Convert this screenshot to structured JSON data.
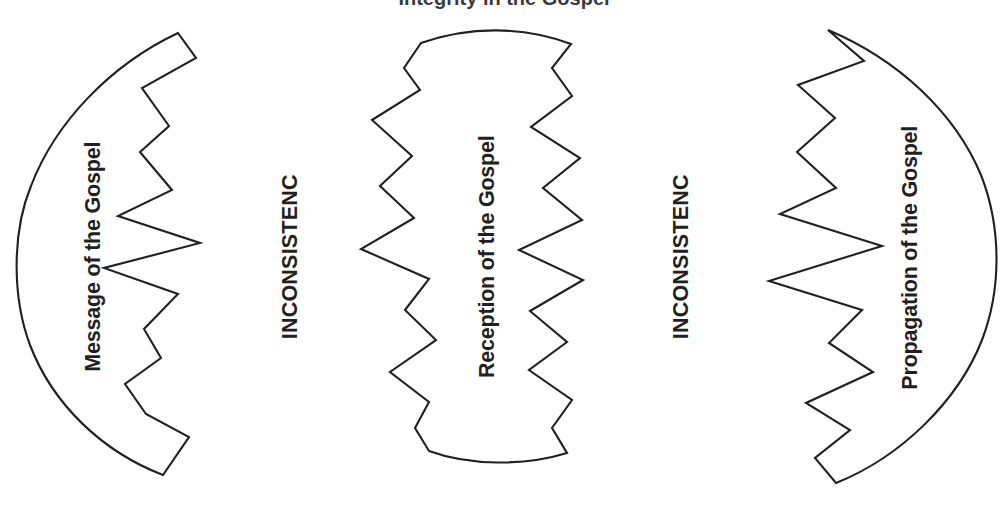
{
  "diagram": {
    "type": "process-flow",
    "title_partial": "Integrity in the Gospel",
    "background_color": "#ffffff",
    "stroke_color": "#231f20",
    "text_color": "#231f20",
    "orientation": "horizontal-left-to-right",
    "text_orientation": "vertical-rotated-90-ccw",
    "shapes": [
      {
        "id": "message",
        "label": "Message of the Gospel",
        "edge_left": "smooth-arc",
        "edge_right": "zigzag",
        "role": "stage"
      },
      {
        "id": "reception",
        "label": "Reception of the Gospel",
        "edge_left": "zigzag",
        "edge_right": "zigzag",
        "role": "stage"
      },
      {
        "id": "propagation",
        "label": "Propagation of the Gospel",
        "edge_left": "zigzag",
        "edge_right": "smooth-arc",
        "role": "stage"
      }
    ],
    "connectors": [
      {
        "id": "gap-1",
        "label": "INCONSISTENC",
        "between": [
          "message",
          "reception"
        ]
      },
      {
        "id": "gap-2",
        "label": "INCONSISTENC",
        "between": [
          "reception",
          "propagation"
        ]
      }
    ]
  }
}
